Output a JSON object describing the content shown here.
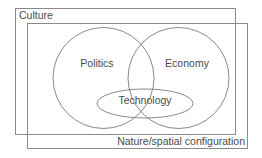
{
  "diagram": {
    "outer_frame": {
      "label": "Culture"
    },
    "inner_frame": {
      "label": "Nature/spatial configuration"
    },
    "sets": [
      {
        "id": "politics",
        "label": "Politics"
      },
      {
        "id": "economy",
        "label": "Economy"
      },
      {
        "id": "technology",
        "label": "Technology"
      }
    ],
    "colors": {
      "line": "#8a8a8a",
      "text": "#4a4a4a",
      "background": "#ffffff"
    }
  }
}
